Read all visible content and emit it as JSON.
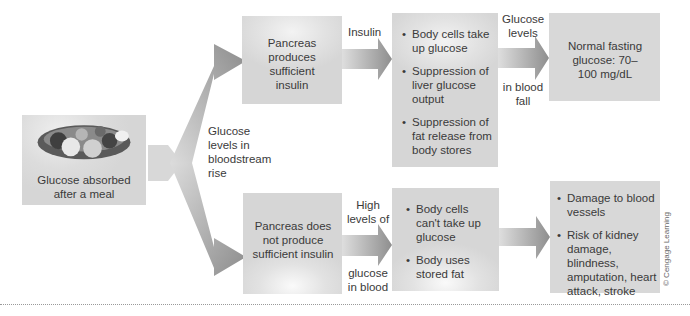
{
  "diagram": {
    "start": {
      "label": "Glucose absorbed after a meal",
      "image": "meal-food-icon"
    },
    "branch_label": "Glucose levels in bloodstream rise",
    "top_path": {
      "pancreas": "Pancreas produces sufficient insulin",
      "arrow_label": "Insulin",
      "effects": [
        "Body cells take up glucose",
        "Suppression of liver glucose output",
        "Suppression of fat release from body stores"
      ],
      "arrow_label_top": "Glucose levels",
      "arrow_label_bottom": "in blood fall",
      "result": "Normal fasting glucose: 70–100 mg/dL"
    },
    "bottom_path": {
      "pancreas": "Pancreas does not produce sufficient insulin",
      "arrow_label_top": "High levels of",
      "arrow_label_bottom": "glucose in blood",
      "effects": [
        "Body cells can't take up glucose",
        "Body uses stored fat"
      ],
      "result": [
        "Damage to blood vessels",
        "Risk of kidney damage, blindness, amputation, heart attack, stroke"
      ]
    },
    "credit": "© Cengage Learning"
  },
  "colors": {
    "box": "#d9d9d9",
    "arrow_dark": "#8c8c8c",
    "arrow_light": "#dcdcdc",
    "text": "#3a3a3a"
  }
}
